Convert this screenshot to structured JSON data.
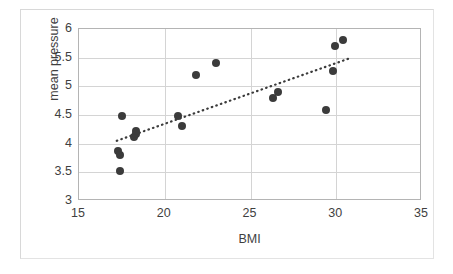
{
  "chart_data": {
    "type": "scatter",
    "title": "",
    "xlabel": "BMI",
    "ylabel": "mean pressure",
    "xlim": [
      15,
      35
    ],
    "ylim": [
      3,
      6
    ],
    "xticks": [
      15,
      20,
      25,
      30,
      35
    ],
    "yticks": [
      3,
      3.5,
      4,
      4.5,
      5,
      5.5,
      6
    ],
    "xtick_labels": [
      "15",
      "20",
      "25",
      "30",
      "35"
    ],
    "ytick_labels": [
      "3",
      "3.5",
      "4",
      "4.5",
      "5",
      "5.5",
      "6"
    ],
    "grid": "horizontal-and-vertical",
    "legend": "none",
    "marker_color": "#3b3b3b",
    "gridline_color": "#d4d4d4",
    "axis_color": "#b4b4b4",
    "points": [
      {
        "x": 17.4,
        "y": 3.52
      },
      {
        "x": 17.3,
        "y": 3.88
      },
      {
        "x": 17.4,
        "y": 3.8
      },
      {
        "x": 17.5,
        "y": 4.48
      },
      {
        "x": 18.2,
        "y": 4.12
      },
      {
        "x": 18.3,
        "y": 4.17
      },
      {
        "x": 18.3,
        "y": 4.22
      },
      {
        "x": 20.8,
        "y": 4.48
      },
      {
        "x": 21.0,
        "y": 4.3
      },
      {
        "x": 21.8,
        "y": 5.19
      },
      {
        "x": 23.0,
        "y": 5.41
      },
      {
        "x": 26.3,
        "y": 4.8
      },
      {
        "x": 26.6,
        "y": 4.9
      },
      {
        "x": 29.4,
        "y": 4.59
      },
      {
        "x": 29.8,
        "y": 5.26
      },
      {
        "x": 29.9,
        "y": 5.7
      },
      {
        "x": 30.4,
        "y": 5.8
      }
    ],
    "trendline": {
      "style": "dotted",
      "color": "#3b3b3b",
      "x_start": 17.2,
      "y_start": 4.05,
      "x_end": 30.7,
      "y_end": 5.48
    }
  }
}
